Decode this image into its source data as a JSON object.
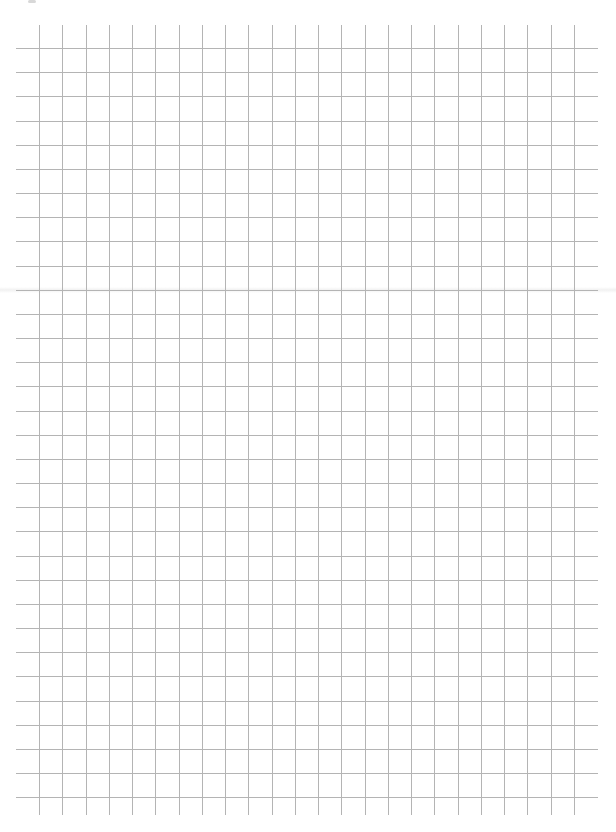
{
  "page": {
    "type": "graph-paper",
    "background_color": "#ffffff",
    "line_color": "#b4b4b4"
  },
  "grid": {
    "horizontal_lines": {
      "count": 32,
      "first_y": 48,
      "spacing": 24.17,
      "x_start": 16,
      "x_end": 598
    },
    "vertical_lines": {
      "count": 24,
      "first_x": 39,
      "spacing": 23.26,
      "y_start": 25,
      "y_end": 815
    }
  }
}
